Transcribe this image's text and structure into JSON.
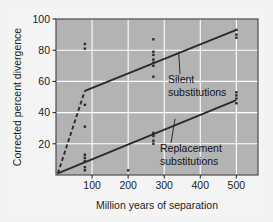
{
  "chart_data": {
    "type": "scatter",
    "title": "",
    "subtitle": "",
    "xlabel": "Million years of separation",
    "ylabel": "Corrected percent divergence",
    "xlim": [
      0,
      560
    ],
    "ylim": [
      0,
      100
    ],
    "xticks": [
      100,
      200,
      300,
      400,
      500
    ],
    "yticks": [
      20,
      40,
      60,
      80,
      100
    ],
    "grid": true,
    "grid_color": "#ffffff",
    "plot_background": "#b3b3b3",
    "legend_position": "inline-annotations",
    "series": [
      {
        "name": "Silent substitutions",
        "annotation": "Silent\nsubstitutions",
        "label_line1": "Silent",
        "label_line2": "substitutions",
        "color": "#2b2b2b",
        "line_style_segment1": "dashed",
        "line_style_segment2": "solid",
        "fit_points": [
          {
            "x": 5,
            "y": 1
          },
          {
            "x": 80,
            "y": 54
          },
          {
            "x": 500,
            "y": 93
          }
        ],
        "points": [
          {
            "x": 80,
            "y": 84
          },
          {
            "x": 80,
            "y": 81
          },
          {
            "x": 80,
            "y": 45
          },
          {
            "x": 80,
            "y": 31
          },
          {
            "x": 270,
            "y": 87
          },
          {
            "x": 270,
            "y": 79
          },
          {
            "x": 270,
            "y": 77
          },
          {
            "x": 270,
            "y": 74
          },
          {
            "x": 270,
            "y": 72
          },
          {
            "x": 270,
            "y": 70
          },
          {
            "x": 270,
            "y": 63
          },
          {
            "x": 500,
            "y": 93
          },
          {
            "x": 500,
            "y": 90
          },
          {
            "x": 500,
            "y": 88
          }
        ]
      },
      {
        "name": "Replacement substitutions",
        "annotation": "Replacement\nsubstitutions",
        "label_line1": "Replacement",
        "label_line2": "substitutions",
        "color": "#2b2b2b",
        "line_style_segment1": "solid",
        "line_style_segment2": "solid",
        "fit_points": [
          {
            "x": 5,
            "y": 1
          },
          {
            "x": 500,
            "y": 48
          }
        ],
        "points": [
          {
            "x": 80,
            "y": 13
          },
          {
            "x": 80,
            "y": 11
          },
          {
            "x": 80,
            "y": 9
          },
          {
            "x": 80,
            "y": 5
          },
          {
            "x": 80,
            "y": 3
          },
          {
            "x": 200,
            "y": 3
          },
          {
            "x": 270,
            "y": 27
          },
          {
            "x": 270,
            "y": 25
          },
          {
            "x": 270,
            "y": 22
          },
          {
            "x": 270,
            "y": 20
          },
          {
            "x": 500,
            "y": 53
          },
          {
            "x": 500,
            "y": 51
          },
          {
            "x": 500,
            "y": 49
          },
          {
            "x": 500,
            "y": 46
          }
        ]
      }
    ]
  },
  "axes": {
    "y_title": "Corrected percent divergence",
    "x_title": "Million years of separation",
    "x_tick_labels": [
      "100",
      "200",
      "300",
      "400",
      "500"
    ],
    "y_tick_labels": [
      "20",
      "40",
      "60",
      "80",
      "100"
    ]
  },
  "annotations": {
    "silent": {
      "line1": "Silent",
      "line2": "substitutions"
    },
    "replacement": {
      "line1": "Replacement",
      "line2": "substitutions"
    }
  },
  "colors": {
    "figure_background": "#f2f2f2",
    "plot_background": "#b3b3b3",
    "grid": "#ffffff",
    "data": "#2b2b2b",
    "text": "#1c1c1c",
    "frame": "#4d4d4d"
  }
}
